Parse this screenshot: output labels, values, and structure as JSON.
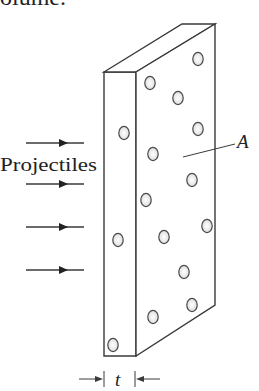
{
  "caption_fragment": "olume.",
  "figure": {
    "projectiles_label": "Projectiles",
    "area_label": "A",
    "thickness_label": "t",
    "stroke_color": "#3a3a3a",
    "particle_fill": "#f2f2f2",
    "particle_stroke": "#4a4a4a",
    "arrows": [
      {
        "y": 143
      },
      {
        "y": 184
      },
      {
        "y": 227
      },
      {
        "y": 270
      }
    ],
    "particles_side_face": [
      {
        "cx": 198,
        "cy": 59
      },
      {
        "cx": 150,
        "cy": 83
      },
      {
        "cx": 178,
        "cy": 98
      },
      {
        "cx": 198,
        "cy": 129
      },
      {
        "cx": 153,
        "cy": 154
      },
      {
        "cx": 192,
        "cy": 180
      },
      {
        "cx": 146,
        "cy": 200
      },
      {
        "cx": 207,
        "cy": 226
      },
      {
        "cx": 164,
        "cy": 237
      },
      {
        "cx": 184,
        "cy": 272
      },
      {
        "cx": 192,
        "cy": 305
      },
      {
        "cx": 153,
        "cy": 317
      }
    ],
    "particles_front_face": [
      {
        "cx": 124,
        "cy": 133
      },
      {
        "cx": 118,
        "cy": 240
      },
      {
        "cx": 113,
        "cy": 345
      }
    ]
  }
}
